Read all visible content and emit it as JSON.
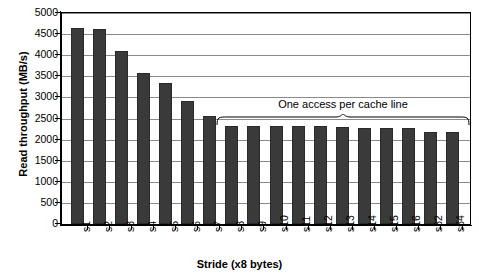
{
  "chart_data": {
    "type": "bar",
    "title": "",
    "xlabel": "Stride (x8 bytes)",
    "ylabel": "Read throughput (MB/s)",
    "categories": [
      "s1",
      "s2",
      "s3",
      "s4",
      "s5",
      "s6",
      "s7",
      "s8",
      "s9",
      "s10",
      "s11",
      "s12",
      "s13",
      "s14",
      "s15",
      "s16",
      "s32",
      "s64"
    ],
    "values": [
      4650,
      4620,
      4090,
      3585,
      3350,
      2920,
      2560,
      2330,
      2320,
      2320,
      2320,
      2320,
      2290,
      2280,
      2280,
      2270,
      2170,
      2170
    ],
    "ylim": [
      0,
      5000
    ],
    "ytick_step": 500,
    "yticks": [
      0,
      500,
      1000,
      1500,
      2000,
      2500,
      3000,
      3500,
      4000,
      4500,
      5000
    ],
    "ytick_labels": [
      "0",
      "500",
      "1000",
      "1500",
      "2000",
      "2500",
      "3000",
      "3500",
      "4000",
      "4500",
      "5000"
    ],
    "grid": true,
    "grid_axis": "y",
    "legend": null,
    "series_name": "Read throughput",
    "bar_color": "#3a3a3a",
    "annotations": [
      {
        "text": "One access per cache line",
        "type": "brace",
        "covers_categories": [
          "s8",
          "s9",
          "s10",
          "s11",
          "s12",
          "s13",
          "s14",
          "s15",
          "s16",
          "s32",
          "s64"
        ]
      }
    ]
  }
}
